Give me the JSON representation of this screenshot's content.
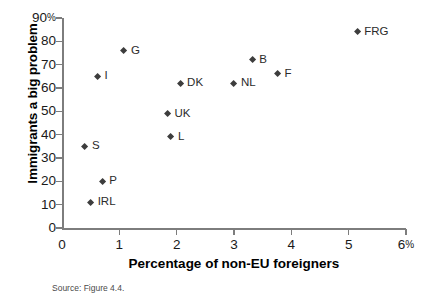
{
  "chart_data": {
    "type": "scatter",
    "title": "",
    "xlabel": "Percentage of non-EU foreigners",
    "ylabel": "Immigrants a big problem",
    "xlim": [
      0,
      6
    ],
    "ylim": [
      0,
      90
    ],
    "x_ticks": [
      "0",
      "1",
      "2",
      "3",
      "4",
      "5",
      "6"
    ],
    "x_tick_suffix_last": "%",
    "y_ticks": [
      "0",
      "10",
      "20",
      "30",
      "40",
      "50",
      "60",
      "70",
      "80",
      "90"
    ],
    "y_tick_suffix_last": "%",
    "grid": false,
    "legend": "none",
    "marker": "diamond",
    "points": [
      {
        "label": "S",
        "x": 0.4,
        "y": 35
      },
      {
        "label": "IRL",
        "x": 0.5,
        "y": 11
      },
      {
        "label": "I",
        "x": 0.62,
        "y": 65
      },
      {
        "label": "P",
        "x": 0.7,
        "y": 20
      },
      {
        "label": "G",
        "x": 1.08,
        "y": 76
      },
      {
        "label": "UK",
        "x": 1.84,
        "y": 49
      },
      {
        "label": "L",
        "x": 1.9,
        "y": 39
      },
      {
        "label": "DK",
        "x": 2.06,
        "y": 62
      },
      {
        "label": "NL",
        "x": 3.0,
        "y": 62
      },
      {
        "label": "B",
        "x": 3.32,
        "y": 72
      },
      {
        "label": "F",
        "x": 3.76,
        "y": 66
      },
      {
        "label": "FRG",
        "x": 5.15,
        "y": 84
      }
    ]
  },
  "source_note": "Source: Figure 4.4.",
  "colors": {
    "marker": "#3d3d3d",
    "axis": "#7d7d7d",
    "text": "#1a1a1a"
  }
}
